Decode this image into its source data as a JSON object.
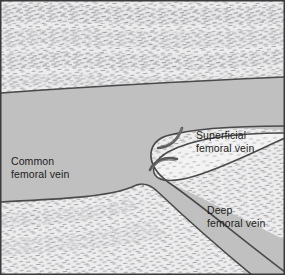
{
  "figure": {
    "width": 285,
    "height": 275
  },
  "colors": {
    "tissue_fill": "#ededed",
    "tissue_fill_light": "#f4f4f4",
    "vessel_lumen": "#c0c0c0",
    "vessel_outline": "#4a4a4a",
    "stipple": "#8c8c93",
    "label_text": "#1c1c1c",
    "frame_border": "#3a3a3a"
  },
  "labels": {
    "superficial_femoral_vein": {
      "line1": "Superficial",
      "line2": "femoral vein"
    },
    "common_femoral_vein": {
      "line1": "Common",
      "line2": "femoral vein"
    },
    "deep_femoral_vein": {
      "line1": "Deep",
      "line2": "femoral vein"
    }
  },
  "structures": {
    "common_femoral_vein": "common-femoral-vein-lumen",
    "superficial_femoral_vein": "superficial-femoral-vein-lumen",
    "deep_femoral_vein": "deep-femoral-vein-lumen",
    "septum": "bifurcation-septum",
    "valve_cusp_upper": "upper-valve-cusp",
    "valve_cusp_lower": "lower-valve-cusp"
  }
}
